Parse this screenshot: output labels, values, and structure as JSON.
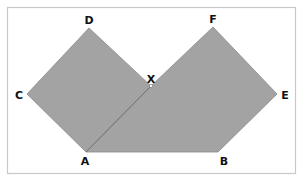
{
  "diagram": {
    "type": "geometry",
    "colors": {
      "fill": "#a3a3a3",
      "edge": "#8c8c8c",
      "frame": "#c8c8c8",
      "background": "#ffffff",
      "label": "#111111"
    },
    "points": {
      "A": {
        "label": "A",
        "x": 86,
        "y": 152
      },
      "B": {
        "label": "B",
        "x": 218,
        "y": 152
      },
      "C": {
        "label": "C",
        "x": 27,
        "y": 94
      },
      "D": {
        "label": "D",
        "x": 89,
        "y": 28
      },
      "E": {
        "label": "E",
        "x": 277,
        "y": 94
      },
      "F": {
        "label": "F",
        "x": 213,
        "y": 27
      },
      "X": {
        "label": "X",
        "x": 151,
        "y": 86
      }
    },
    "shapes": [
      {
        "name": "left-square",
        "vertices": [
          "A",
          "C",
          "D",
          "X"
        ]
      },
      {
        "name": "right-pentagon",
        "vertices": [
          "A",
          "B",
          "E",
          "F",
          "X"
        ]
      }
    ],
    "segments": [
      {
        "from": "A",
        "to": "F",
        "note": "passes through X"
      }
    ]
  }
}
